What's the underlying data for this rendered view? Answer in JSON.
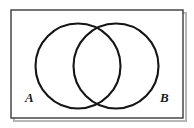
{
  "figure": {
    "kind": "venn-diagram",
    "title": "",
    "background_color": "#ffffff",
    "universe": {
      "name": "universal-set-rectangle",
      "stroke_color": "#3a3a3a",
      "fill_color": "#ffffff",
      "shadow_color": "#b5b5b5",
      "x": 11,
      "y": 10,
      "width": 172,
      "height": 108,
      "stroke_width": 1.4
    },
    "sets": [
      {
        "id": "set-a",
        "label": "A",
        "label_x": 30,
        "label_y": 98,
        "circle": {
          "cx": 78,
          "cy": 66,
          "r": 42.5
        },
        "stroke_color": "#141414",
        "stroke_width": 2.1,
        "fill": "none"
      },
      {
        "id": "set-b",
        "label": "B",
        "label_x": 165,
        "label_y": 98,
        "circle": {
          "cx": 116,
          "cy": 66,
          "r": 42.5
        },
        "stroke_color": "#141414",
        "stroke_width": 2.1,
        "fill": "none"
      }
    ],
    "intersection": {
      "name": "a-intersect-b",
      "label": "",
      "top_point": {
        "x": 97,
        "y": 27
      },
      "bottom_point": {
        "x": 97,
        "y": 106
      },
      "fill": "none"
    }
  }
}
